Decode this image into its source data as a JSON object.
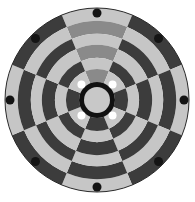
{
  "board": {
    "name": "Circular chess board",
    "center": [
      97,
      100
    ],
    "outer_radius": 92,
    "sectors": 8,
    "sector_offset_deg": -22.5,
    "ring_radii": [
      92,
      79,
      66,
      55,
      42,
      31,
      18
    ],
    "colors": {
      "light": "#c6c6c6",
      "dark": "#3c3c3c",
      "highlight": "#8a8a8a",
      "outline": "#2a2a2a",
      "hub_ring": "#111111",
      "hub_center": "#c8c8c8",
      "marker": "#141414",
      "inner_hole": "#ffffff"
    },
    "cells": [
      [
        "light",
        "highlight",
        "light",
        "highlight",
        "light",
        "highlight"
      ],
      [
        "dark",
        "light",
        "dark",
        "light",
        "dark",
        "light"
      ],
      [
        "light",
        "dark",
        "light",
        "dark",
        "light",
        "dark"
      ],
      [
        "dark",
        "light",
        "dark",
        "light",
        "dark",
        "light"
      ],
      [
        "light",
        "dark",
        "light",
        "dark",
        "light",
        "dark"
      ],
      [
        "dark",
        "light",
        "dark",
        "light",
        "dark",
        "light"
      ],
      [
        "light",
        "dark",
        "light",
        "dark",
        "light",
        "dark"
      ],
      [
        "dark",
        "light",
        "dark",
        "light",
        "dark",
        "light"
      ]
    ],
    "highlighted_file": "north sector (top wedge)",
    "hub": {
      "ring_outer_radius": 18,
      "ring_inner_radius": 13
    },
    "outer_markers": {
      "count": 8,
      "radius": 87,
      "dot_radius": 4.5,
      "angles_deg": [
        0,
        45,
        90,
        135,
        180,
        225,
        270,
        315
      ]
    },
    "inner_holes": {
      "count": 4,
      "radius": 22,
      "dot_radius": 4,
      "angles_deg": [
        45,
        135,
        225,
        315
      ]
    }
  }
}
